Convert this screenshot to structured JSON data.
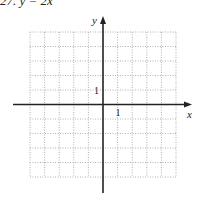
{
  "header": {
    "text": "27.   y = 2x"
  },
  "graph": {
    "x_axis_label": "x",
    "y_axis_label": "y",
    "x_tick_label": "1",
    "y_tick_label": "1",
    "grid": {
      "columns": 10,
      "rows": 10,
      "line_style": "dotted",
      "color": "#b0b0b0"
    },
    "axis_color": "#222222"
  }
}
